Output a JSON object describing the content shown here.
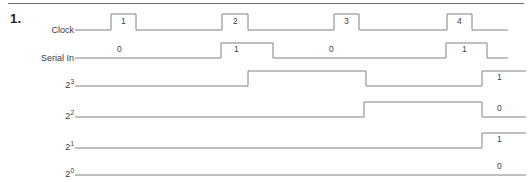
{
  "problem": {
    "number": "1."
  },
  "diagram": {
    "type": "timing-diagram",
    "title": "",
    "width": 532,
    "height": 182,
    "line_color": "#808285",
    "text_color": "#404042",
    "rule_color": "#6f7072",
    "rows": [
      {
        "id": "clock",
        "label": "Clock",
        "label_html": "Clock",
        "baseline_y": 30,
        "high_y": 14,
        "start_x": 75,
        "end_x": 508,
        "transitions": [
          {
            "x": 111,
            "level": "high"
          },
          {
            "x": 136,
            "level": "low"
          },
          {
            "x": 222,
            "level": "high"
          },
          {
            "x": 248,
            "level": "low"
          },
          {
            "x": 334,
            "level": "high"
          },
          {
            "x": 359,
            "level": "low"
          },
          {
            "x": 447,
            "level": "high"
          },
          {
            "x": 472,
            "level": "low"
          }
        ],
        "pulse_labels": [
          {
            "text": "1",
            "x": 121,
            "y": 16
          },
          {
            "text": "2",
            "x": 233,
            "y": 16
          },
          {
            "text": "3",
            "x": 344,
            "y": 16
          },
          {
            "text": "4",
            "x": 457,
            "y": 16
          }
        ]
      },
      {
        "id": "serial-in",
        "label": "Serial In",
        "label_html": "Serial In",
        "baseline_y": 58,
        "high_y": 43,
        "start_x": 75,
        "end_x": 508,
        "transitions": [
          {
            "x": 221,
            "level": "high"
          },
          {
            "x": 273,
            "level": "low"
          },
          {
            "x": 446,
            "level": "high"
          },
          {
            "x": 487,
            "level": "low"
          }
        ],
        "pulse_labels": [
          {
            "text": "0",
            "x": 117,
            "y": 44
          },
          {
            "text": "1",
            "x": 234,
            "y": 44
          },
          {
            "text": "0",
            "x": 329,
            "y": 44
          },
          {
            "text": "1",
            "x": 462,
            "y": 44
          }
        ]
      },
      {
        "id": "bit-2-3",
        "label": "2^3",
        "label_base": "2",
        "label_exp": "3",
        "baseline_y": 86,
        "high_y": 71,
        "start_x": 75,
        "end_x": 526,
        "transitions": [
          {
            "x": 248,
            "level": "high"
          },
          {
            "x": 366,
            "level": "low"
          },
          {
            "x": 482,
            "level": "high"
          }
        ],
        "pulse_labels": [
          {
            "text": "1",
            "x": 497,
            "y": 72
          }
        ]
      },
      {
        "id": "bit-2-2",
        "label": "2^2",
        "label_base": "2",
        "label_exp": "2",
        "baseline_y": 117,
        "high_y": 102,
        "start_x": 75,
        "end_x": 526,
        "transitions": [
          {
            "x": 364,
            "level": "high"
          },
          {
            "x": 482,
            "level": "low"
          }
        ],
        "pulse_labels": [
          {
            "text": "0",
            "x": 497,
            "y": 103
          }
        ]
      },
      {
        "id": "bit-2-1",
        "label": "2^1",
        "label_base": "2",
        "label_exp": "1",
        "baseline_y": 148,
        "high_y": 133,
        "start_x": 75,
        "end_x": 526,
        "transitions": [
          {
            "x": 482,
            "level": "high"
          }
        ],
        "pulse_labels": [
          {
            "text": "1",
            "x": 497,
            "y": 134
          }
        ]
      },
      {
        "id": "bit-2-0",
        "label": "2^0",
        "label_base": "2",
        "label_exp": "0",
        "baseline_y": 175,
        "high_y": 160,
        "start_x": 75,
        "end_x": 526,
        "transitions": [],
        "pulse_labels": [
          {
            "text": "0",
            "x": 497,
            "y": 161
          }
        ]
      }
    ]
  }
}
